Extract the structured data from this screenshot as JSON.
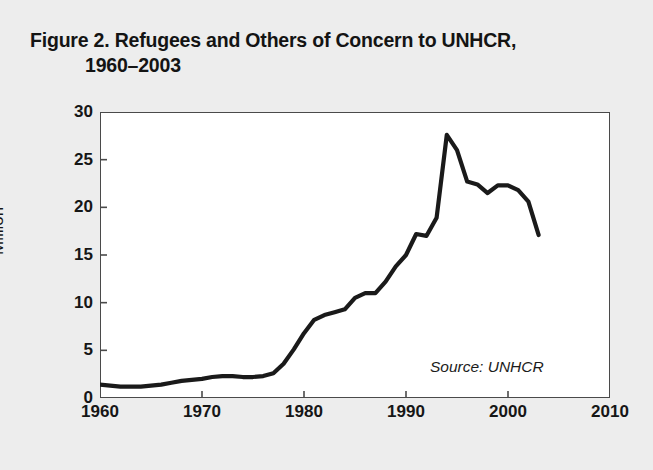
{
  "title": {
    "line1": "Figure 2. Refugees and Others of Concern to UNHCR,",
    "line2": "1960–2003"
  },
  "source_note": "Source: UNHCR",
  "colors": {
    "background": "#ededed",
    "plot_background": "#ffffff",
    "frame": "#4a4a4a",
    "line": "#1a1a1a",
    "text": "#161616"
  },
  "chart_data": {
    "type": "line",
    "title": "Figure 2. Refugees and Others of Concern to UNHCR, 1960–2003",
    "xlabel": "",
    "ylabel": "Million",
    "xlim": [
      1960,
      2010
    ],
    "ylim": [
      0,
      30
    ],
    "grid": false,
    "legend": null,
    "annotations": [
      "Source: UNHCR"
    ],
    "xticks": [
      1960,
      1970,
      1980,
      1990,
      2000,
      2010
    ],
    "xtick_labels": [
      "1960",
      "1970",
      "1980",
      "1990",
      "2000",
      "2010"
    ],
    "yticks": [
      0,
      5,
      10,
      15,
      20,
      25,
      30
    ],
    "ytick_labels": [
      "0",
      "5",
      "10",
      "15",
      "20",
      "25",
      "30"
    ],
    "series": [
      {
        "name": "Refugees and others of concern to UNHCR",
        "units": "Million",
        "x": [
          1960,
          1961,
          1962,
          1963,
          1964,
          1965,
          1966,
          1967,
          1968,
          1969,
          1970,
          1971,
          1972,
          1973,
          1974,
          1975,
          1976,
          1977,
          1978,
          1979,
          1980,
          1981,
          1982,
          1983,
          1984,
          1985,
          1986,
          1987,
          1988,
          1989,
          1990,
          1991,
          1992,
          1993,
          1994,
          1995,
          1996,
          1997,
          1998,
          1999,
          2000,
          2001,
          2002,
          2003
        ],
        "values": [
          1.4,
          1.3,
          1.2,
          1.2,
          1.2,
          1.3,
          1.4,
          1.6,
          1.8,
          1.9,
          2.0,
          2.2,
          2.3,
          2.3,
          2.2,
          2.2,
          2.3,
          2.6,
          3.6,
          5.1,
          6.8,
          8.2,
          8.7,
          9.0,
          9.3,
          10.5,
          11.0,
          11.0,
          12.2,
          13.8,
          15.0,
          17.2,
          17.0,
          18.9,
          27.6,
          26.0,
          22.7,
          22.4,
          21.5,
          22.3,
          22.3,
          21.8,
          20.6,
          17.1
        ]
      }
    ]
  },
  "axes": {
    "y_title": "Million",
    "y_ticks": [
      {
        "value": 0,
        "label": "0"
      },
      {
        "value": 5,
        "label": "5"
      },
      {
        "value": 10,
        "label": "10"
      },
      {
        "value": 15,
        "label": "15"
      },
      {
        "value": 20,
        "label": "20"
      },
      {
        "value": 25,
        "label": "25"
      },
      {
        "value": 30,
        "label": "30"
      }
    ],
    "x_ticks": [
      {
        "value": 1960,
        "label": "1960"
      },
      {
        "value": 1970,
        "label": "1970"
      },
      {
        "value": 1980,
        "label": "1980"
      },
      {
        "value": 1990,
        "label": "1990"
      },
      {
        "value": 2000,
        "label": "2000"
      },
      {
        "value": 2010,
        "label": "2010"
      }
    ]
  }
}
